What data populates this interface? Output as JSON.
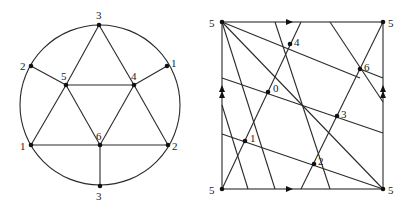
{
  "left_figure": {
    "description": "Graph embedded in a disk with boundary identifications",
    "circle": {
      "cx": 100,
      "cy": 105,
      "r": 80
    },
    "vertices": [
      {
        "id": "v3top",
        "label": "3",
        "x": 99,
        "y": 25,
        "lx": 96,
        "ly": 19
      },
      {
        "id": "v2left",
        "label": "2",
        "x": 31,
        "y": 66,
        "lx": 20,
        "ly": 70
      },
      {
        "id": "v1right",
        "label": "1",
        "x": 167,
        "y": 66,
        "lx": 171,
        "ly": 67
      },
      {
        "id": "v5",
        "label": "5",
        "x": 66,
        "y": 85,
        "lx": 61,
        "ly": 80
      },
      {
        "id": "v4",
        "label": "4",
        "x": 134,
        "y": 85,
        "lx": 131,
        "ly": 80
      },
      {
        "id": "v1left",
        "label": "1",
        "x": 31,
        "y": 145,
        "lx": 20,
        "ly": 150
      },
      {
        "id": "v6",
        "label": "6",
        "x": 100,
        "y": 145,
        "lx": 96,
        "ly": 140
      },
      {
        "id": "v2right",
        "label": "2",
        "x": 168,
        "y": 145,
        "lx": 172,
        "ly": 150
      },
      {
        "id": "v3bottom",
        "label": "3",
        "x": 100,
        "y": 186,
        "lx": 96,
        "ly": 200
      }
    ],
    "edges": [
      [
        "v3top",
        "v5"
      ],
      [
        "v3top",
        "v4"
      ],
      [
        "v2left",
        "v5"
      ],
      [
        "v1right",
        "v4"
      ],
      [
        "v5",
        "v4"
      ],
      [
        "v5",
        "v1left"
      ],
      [
        "v5",
        "v6"
      ],
      [
        "v4",
        "v6"
      ],
      [
        "v4",
        "v2right"
      ],
      [
        "v1left",
        "v6"
      ],
      [
        "v6",
        "v2right"
      ],
      [
        "v6",
        "v3bottom"
      ]
    ]
  },
  "right_figure": {
    "description": "Torus square with identified edges (arrows), triangulated",
    "square": {
      "x1": 222,
      "y1": 22,
      "x2": 383,
      "y2": 189
    },
    "corner_label": "5",
    "corners": [
      {
        "label": "5",
        "x": 222,
        "y": 22,
        "lx": 209,
        "ly": 27
      },
      {
        "label": "5",
        "x": 383,
        "y": 22,
        "lx": 388,
        "ly": 27
      },
      {
        "label": "5",
        "x": 222,
        "y": 189,
        "lx": 209,
        "ly": 194
      },
      {
        "label": "5",
        "x": 383,
        "y": 189,
        "lx": 388,
        "ly": 194
      }
    ],
    "vertices": [
      {
        "label": "4",
        "x": 290,
        "y": 44,
        "lx": 294,
        "ly": 46
      },
      {
        "label": "6",
        "x": 360,
        "y": 69,
        "lx": 364,
        "ly": 71
      },
      {
        "label": "0",
        "x": 268,
        "y": 92,
        "lx": 273,
        "ly": 92
      },
      {
        "label": "3",
        "x": 337,
        "y": 116,
        "lx": 341,
        "ly": 118
      },
      {
        "label": "1",
        "x": 245,
        "y": 141,
        "lx": 250,
        "ly": 142
      },
      {
        "label": "2",
        "x": 314,
        "y": 164,
        "lx": 318,
        "ly": 165
      }
    ],
    "segments": [
      [
        222,
        22,
        383,
        189
      ],
      [
        222,
        22,
        360,
        78
      ],
      [
        222,
        78,
        383,
        133
      ],
      [
        222,
        134,
        383,
        189
      ],
      [
        222,
        22,
        275,
        189
      ],
      [
        275,
        22,
        330,
        189
      ],
      [
        330,
        22,
        383,
        102
      ],
      [
        222,
        105,
        248,
        189
      ],
      [
        222,
        189,
        301,
        22
      ],
      [
        301,
        189,
        383,
        22
      ],
      [
        360,
        69,
        383,
        78
      ]
    ],
    "arrows": {
      "horizontal": [
        {
          "x": 288,
          "y": 22
        },
        {
          "x": 288,
          "y": 189
        }
      ],
      "vertical_double": [
        {
          "x": 222,
          "y": 90
        },
        {
          "x": 383,
          "y": 90
        }
      ]
    }
  }
}
